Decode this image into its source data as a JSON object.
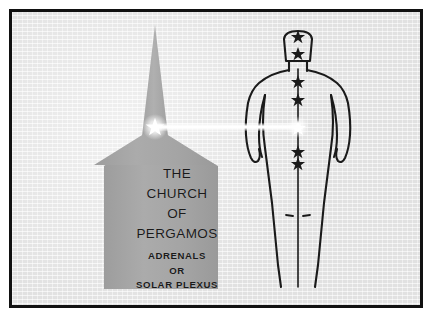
{
  "plate": {
    "background_color": "#e9e9e9",
    "frame_color": "#111111",
    "page_color": "#ffffff"
  },
  "church": {
    "fill_color": "#a8a8a8",
    "title_lines": [
      "THE",
      "CHURCH",
      "OF",
      "PERGAMOS"
    ],
    "subtitle_lines": [
      "ADRENALS",
      "OR",
      "SOLAR PLEXUS"
    ],
    "steeple_star_color": "#ffffff"
  },
  "figure": {
    "outline_color": "#1a1a1a",
    "stars": [
      {
        "name": "crown-star",
        "color": "#1a1a1a",
        "cx": 295,
        "cy": 33,
        "r": 6.2
      },
      {
        "name": "head-star",
        "color": "#1a1a1a",
        "cx": 295,
        "cy": 50,
        "r": 6.2
      },
      {
        "name": "throat-star",
        "color": "#1a1a1a",
        "cx": 295,
        "cy": 78,
        "r": 6.2
      },
      {
        "name": "chest-star",
        "color": "#1a1a1a",
        "cx": 295,
        "cy": 96,
        "r": 6.2
      },
      {
        "name": "solar-plexus-star",
        "color": "#ffffff",
        "cx": 295,
        "cy": 124,
        "r": 6.6
      },
      {
        "name": "abdomen-star",
        "color": "#1a1a1a",
        "cx": 295,
        "cy": 148,
        "r": 6.2
      },
      {
        "name": "sacral-star",
        "color": "#1a1a1a",
        "cx": 295,
        "cy": 160,
        "r": 6.2
      }
    ]
  },
  "beam": {
    "name": "light-beam",
    "color": "#ffffff",
    "from_x": 152,
    "to_x": 296,
    "y": 124
  }
}
